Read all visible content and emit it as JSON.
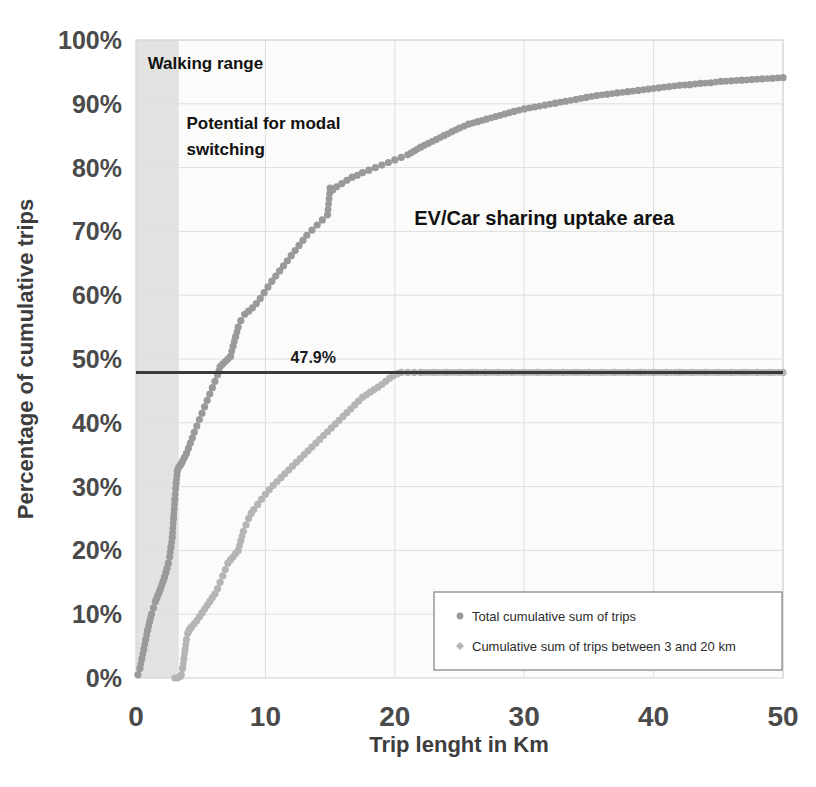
{
  "chart_data": {
    "type": "line",
    "title": "",
    "xlabel": "Trip lenght in Km",
    "ylabel": "Percentage of cumulative trips",
    "xlim": [
      0,
      50
    ],
    "ylim": [
      0,
      100
    ],
    "xticks": [
      "0",
      "10",
      "20",
      "30",
      "40",
      "50"
    ],
    "yticks": [
      "0%",
      "10%",
      "20%",
      "30%",
      "40%",
      "50%",
      "60%",
      "70%",
      "80%",
      "90%",
      "100%"
    ],
    "grid": true,
    "legend_position": "bottom-right",
    "marker_style": "dots",
    "reference_line": {
      "label": "47.9%",
      "value": 47.9,
      "color": "#3a3a3a"
    },
    "shaded_bands": [
      {
        "name": "walking-range-band",
        "x_start": 0,
        "x_end": 3.3,
        "color": "#e2e2e0"
      }
    ],
    "annotations": [
      {
        "name": "walking-range",
        "text": "Walking range",
        "x": 0.9,
        "y": 95.5
      },
      {
        "name": "potential-modal-switching-line1",
        "text": "Potential for modal",
        "x": 3.9,
        "y": 86.0
      },
      {
        "name": "potential-modal-switching-line2",
        "text": "switching",
        "x": 3.9,
        "y": 82.0
      },
      {
        "name": "ev-car-sharing-uptake",
        "text": "EV/Car sharing uptake area",
        "x": 21.5,
        "y": 71.0
      }
    ],
    "series": [
      {
        "name": "Total cumulative sum of trips",
        "color": "#9a9a9a",
        "x": [
          0.15,
          0.3,
          0.45,
          0.6,
          0.75,
          0.9,
          1.05,
          1.2,
          1.35,
          1.5,
          1.6,
          1.7,
          1.8,
          1.9,
          2.0,
          2.1,
          2.2,
          2.3,
          2.4,
          2.5,
          2.6,
          2.7,
          2.8,
          2.9,
          3.0,
          3.1,
          3.2,
          3.3,
          3.4,
          3.5,
          3.6,
          3.75,
          3.9,
          4.05,
          4.2,
          4.35,
          4.5,
          4.7,
          4.9,
          5.1,
          5.3,
          5.5,
          5.7,
          5.9,
          6.1,
          6.3,
          6.5,
          6.7,
          6.9,
          7.1,
          7.3,
          7.5,
          7.7,
          7.9,
          8.1,
          8.4,
          8.7,
          9.0,
          9.3,
          9.6,
          9.9,
          10.2,
          10.5,
          10.8,
          11.1,
          11.4,
          11.7,
          12.0,
          12.3,
          12.6,
          12.9,
          13.2,
          13.6,
          14.0,
          14.4,
          14.8,
          15.0,
          15.2,
          15.5,
          15.9,
          16.3,
          16.7,
          17.1,
          17.5,
          18.0,
          18.5,
          19.0,
          19.5,
          20.0,
          20.5,
          21.0,
          21.5,
          22.0,
          22.6,
          23.2,
          23.8,
          24.4,
          25.0,
          25.7,
          26.4,
          27.1,
          27.8,
          28.5,
          29.2,
          30.0,
          30.8,
          31.6,
          32.4,
          33.2,
          34.0,
          34.8,
          35.6,
          36.4,
          37.2,
          38.0,
          38.8,
          39.6,
          40.4,
          41.2,
          42.0,
          42.8,
          43.6,
          44.4,
          45.2,
          46.0,
          46.8,
          47.6,
          48.4,
          49.2,
          50.0
        ],
        "y": [
          0.5,
          1.5,
          3.0,
          4.5,
          6.0,
          7.5,
          8.8,
          10.0,
          11.0,
          12.0,
          12.5,
          13.0,
          13.5,
          14.0,
          14.6,
          15.2,
          15.8,
          16.5,
          17.2,
          18.0,
          19.0,
          20.5,
          22.0,
          25.0,
          28.0,
          30.5,
          32.5,
          33.0,
          33.3,
          33.6,
          34.0,
          34.6,
          35.2,
          36.0,
          36.8,
          37.6,
          38.5,
          39.5,
          40.5,
          41.5,
          42.5,
          43.5,
          44.5,
          45.5,
          46.5,
          47.5,
          48.8,
          49.2,
          49.6,
          50.0,
          50.4,
          52.0,
          53.5,
          55.0,
          56.0,
          57.0,
          57.5,
          58.0,
          58.7,
          59.5,
          60.4,
          61.3,
          62.2,
          63.0,
          63.8,
          64.6,
          65.4,
          66.2,
          67.0,
          67.8,
          68.6,
          69.4,
          70.2,
          71.0,
          71.8,
          72.6,
          76.8,
          76.5,
          77.0,
          77.5,
          78.0,
          78.5,
          78.8,
          79.2,
          79.6,
          80.0,
          80.4,
          80.8,
          81.2,
          81.6,
          82.0,
          82.6,
          83.2,
          83.8,
          84.4,
          85.0,
          85.6,
          86.2,
          86.8,
          87.2,
          87.6,
          88.0,
          88.4,
          88.8,
          89.2,
          89.5,
          89.8,
          90.1,
          90.4,
          90.7,
          91.0,
          91.3,
          91.5,
          91.7,
          91.9,
          92.1,
          92.3,
          92.5,
          92.7,
          92.9,
          93.0,
          93.2,
          93.3,
          93.5,
          93.6,
          93.7,
          93.8,
          93.9,
          94.0,
          94.1
        ]
      },
      {
        "name": "Cumulative sum of trips between 3 and 20 km",
        "color": "#b5b5b5",
        "x": [
          3.0,
          3.2,
          3.4,
          3.5,
          3.6,
          3.7,
          3.8,
          3.9,
          4.0,
          4.1,
          4.2,
          4.3,
          4.5,
          4.7,
          4.9,
          5.1,
          5.3,
          5.5,
          5.7,
          5.9,
          6.1,
          6.3,
          6.5,
          6.7,
          6.9,
          7.1,
          7.3,
          7.5,
          7.7,
          7.9,
          8.1,
          8.3,
          8.5,
          8.7,
          8.9,
          9.1,
          9.4,
          9.7,
          10.0,
          10.3,
          10.6,
          10.9,
          11.2,
          11.5,
          11.8,
          12.1,
          12.4,
          12.7,
          13.0,
          13.3,
          13.6,
          13.9,
          14.2,
          14.5,
          14.8,
          15.1,
          15.4,
          15.7,
          16.0,
          16.3,
          16.6,
          16.9,
          17.2,
          17.5,
          17.8,
          18.1,
          18.4,
          18.7,
          19.0,
          19.3,
          19.6,
          19.9,
          20.2,
          20.5,
          21.0,
          21.5,
          22.0,
          23.0,
          24.0,
          25.0,
          26.0,
          27.0,
          28.0,
          29.0,
          30.0,
          31.0,
          32.0,
          33.0,
          34.0,
          35.0,
          36.0,
          37.0,
          38.0,
          39.0,
          40.0,
          41.0,
          42.0,
          43.0,
          44.0,
          45.0,
          46.0,
          47.0,
          48.0,
          49.0,
          50.0
        ],
        "y": [
          0.0,
          0.0,
          0.2,
          0.5,
          1.5,
          3.0,
          4.5,
          6.0,
          7.0,
          7.5,
          7.8,
          8.0,
          8.5,
          9.0,
          9.6,
          10.2,
          10.8,
          11.4,
          12.0,
          12.6,
          13.2,
          14.0,
          15.0,
          16.0,
          17.0,
          18.0,
          18.5,
          19.0,
          19.5,
          20.0,
          21.5,
          23.0,
          24.0,
          25.0,
          25.8,
          26.4,
          27.2,
          28.0,
          28.8,
          29.5,
          30.2,
          30.8,
          31.4,
          32.0,
          32.6,
          33.2,
          33.8,
          34.4,
          35.0,
          35.6,
          36.2,
          36.8,
          37.4,
          38.0,
          38.6,
          39.2,
          39.8,
          40.4,
          41.0,
          41.6,
          42.2,
          42.8,
          43.4,
          44.0,
          44.4,
          44.8,
          45.2,
          45.6,
          46.0,
          46.5,
          47.0,
          47.4,
          47.7,
          47.9,
          47.9,
          47.9,
          47.9,
          47.9,
          47.9,
          47.9,
          47.9,
          47.9,
          47.9,
          47.9,
          47.9,
          47.9,
          47.9,
          47.9,
          47.9,
          47.9,
          47.9,
          47.9,
          47.9,
          47.9,
          47.9,
          47.9,
          47.9,
          47.9,
          47.9,
          47.9,
          47.9,
          47.9,
          47.9,
          47.9,
          47.9
        ]
      }
    ],
    "legend": [
      {
        "label": "Total cumulative sum of trips",
        "marker": "round-dot",
        "color": "#9a9a9a"
      },
      {
        "label": "Cumulative sum of trips between 3 and 20 km",
        "marker": "diamond-dot",
        "color": "#b5b5b5"
      }
    ]
  }
}
